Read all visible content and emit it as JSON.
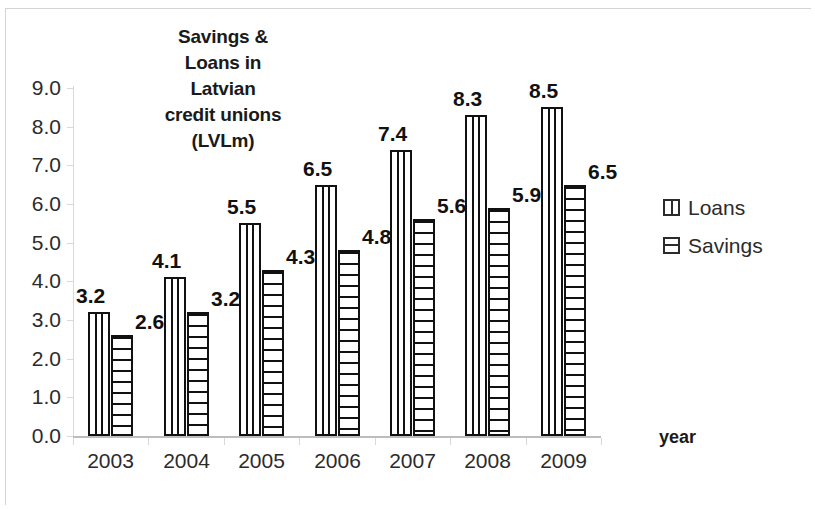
{
  "chart_data": {
    "type": "bar",
    "title": "Savings & Loans in Latvian credit unions (LVLm)",
    "title_lines": [
      "Savings &",
      "Loans in",
      "Latvian",
      "credit unions",
      "(LVLm)"
    ],
    "categories": [
      "2003",
      "2004",
      "2005",
      "2006",
      "2007",
      "2008",
      "2009"
    ],
    "series": [
      {
        "name": "Loans",
        "values": [
          3.2,
          4.1,
          5.5,
          6.5,
          7.4,
          8.3,
          8.5
        ],
        "pattern": "vertical-stripes"
      },
      {
        "name": "Savings",
        "values": [
          2.6,
          3.2,
          4.3,
          4.8,
          5.6,
          5.9,
          6.5
        ],
        "pattern": "horizontal-stripes"
      }
    ],
    "xlabel": "year",
    "ylabel": "",
    "ylim": [
      0.0,
      9.0
    ],
    "ytick_step": 1.0,
    "ytick_labels": [
      "9.0",
      "8.0",
      "7.0",
      "6.0",
      "5.0",
      "4.0",
      "3.0",
      "2.0",
      "1.0",
      "0.0"
    ],
    "data_labels_shown": true,
    "grid": false,
    "legend_position": "right",
    "colors": {
      "bar_outline": "#111111",
      "bar_fill": "#ffffff",
      "axis": "#d9d9d9",
      "text": "#2b2b2b"
    }
  },
  "legend": {
    "items": [
      {
        "label": "Loans",
        "key": "vertical-stripe-key"
      },
      {
        "label": "Savings",
        "key": "horizontal-stripe-key"
      }
    ]
  },
  "axes": {
    "x_title": "year"
  }
}
